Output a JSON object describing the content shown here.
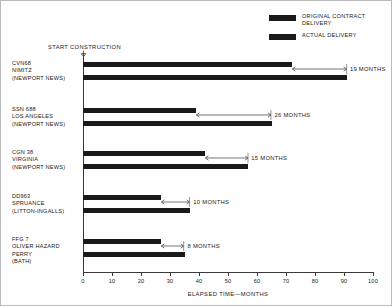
{
  "legend": {
    "items": [
      {
        "label": "ORIGINAL CONTRACT\nDELIVERY",
        "color": "#1a1a1a"
      },
      {
        "label": "ACTUAL DELIVERY",
        "color": "#1a1a1a"
      }
    ]
  },
  "annotations": {
    "start_construction": "START CONSTRUCTION"
  },
  "axis": {
    "title": "ELAPSED TIME—MONTHS",
    "ticks": [
      "0",
      "10",
      "20",
      "30",
      "40",
      "50",
      "60",
      "70",
      "80",
      "90",
      "100"
    ]
  },
  "groups": [
    {
      "label": "CVN68\nNIMITZ\n(NEWPORT NEWS)",
      "slip": "19 MONTHS"
    },
    {
      "label": "SSN 688\nLOS ANGELES\n(NEWPORT NEWS)",
      "slip": "26 MONTHS"
    },
    {
      "label": "CGN 38\nVIRGINIA\n(NEWPORT NEWS)",
      "slip": "15 MONTHS"
    },
    {
      "label": "DD963\nSPRUANCE\n(LITTON-INGALLS)",
      "slip": "10 MONTHS"
    },
    {
      "label": "FFG 7\nOLIVER HAZARD\nPERRY\n(BATH)",
      "slip": "8 MONTHS"
    }
  ],
  "chart_data": {
    "type": "bar",
    "orientation": "horizontal",
    "title": "",
    "xlabel": "ELAPSED TIME—MONTHS",
    "ylabel": "",
    "xlim": [
      0,
      100
    ],
    "xticks": [
      0,
      10,
      20,
      30,
      40,
      50,
      60,
      70,
      80,
      90,
      100
    ],
    "grid": false,
    "legend_position": "top-right",
    "categories": [
      "CVN68 NIMITZ (NEWPORT NEWS)",
      "SSN 688 LOS ANGELES (NEWPORT NEWS)",
      "CGN 38 VIRGINIA (NEWPORT NEWS)",
      "DD963 SPRUANCE (LITTON-INGALLS)",
      "FFG 7 OLIVER HAZARD PERRY (BATH)"
    ],
    "series": [
      {
        "name": "ORIGINAL CONTRACT DELIVERY",
        "values": [
          72,
          39,
          42,
          27,
          27
        ]
      },
      {
        "name": "ACTUAL DELIVERY",
        "values": [
          91,
          65,
          57,
          37,
          35
        ]
      }
    ],
    "annotations": [
      {
        "category": "CVN68 NIMITZ (NEWPORT NEWS)",
        "text": "19 MONTHS",
        "value": 19
      },
      {
        "category": "SSN 688 LOS ANGELES (NEWPORT NEWS)",
        "text": "26 MONTHS",
        "value": 26
      },
      {
        "category": "CGN 38 VIRGINIA (NEWPORT NEWS)",
        "text": "15 MONTHS",
        "value": 15
      },
      {
        "category": "DD963 SPRUANCE (LITTON-INGALLS)",
        "text": "10 MONTHS",
        "value": 10
      },
      {
        "category": "FFG 7 OLIVER HAZARD PERRY (BATH)",
        "text": "8 MONTHS",
        "value": 8
      }
    ],
    "marker_annotation": {
      "text": "START CONSTRUCTION",
      "value": 0
    }
  }
}
